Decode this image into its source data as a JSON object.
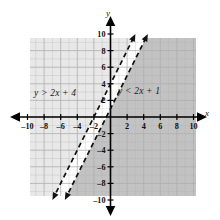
{
  "figure": {
    "kind": "coordinate-plane-graph",
    "axis_x_label": "x",
    "axis_y_label": "y"
  },
  "labels": {
    "left_inequality": "y > 2x + 4",
    "right_inequality": "y < 2x + 1"
  },
  "colors": {
    "grid_line": "#b0b0b0",
    "axis": "#000000",
    "line_stroke": "#111111",
    "shade_light": "#e8e8e8",
    "shade_dark": "#c2c2c2",
    "band_fill": "#ffffff",
    "tick_text": "#111111"
  },
  "chart_data": {
    "type": "line",
    "title": "",
    "xlabel": "x",
    "ylabel": "y",
    "xlim": [
      -10,
      10
    ],
    "ylim": [
      -10,
      10
    ],
    "grid": true,
    "legend": "inline-annotations",
    "x_ticks": [
      -10,
      -8,
      -6,
      -4,
      -2,
      2,
      4,
      6,
      8,
      10
    ],
    "y_ticks": [
      10,
      8,
      6,
      4,
      2,
      -2,
      -4,
      -6,
      -8,
      -10
    ],
    "x_tick_labels": [
      "-10",
      "-8",
      "-6",
      "-4",
      "-2",
      "2",
      "4",
      "6",
      "8",
      "10"
    ],
    "y_tick_labels": [
      "10",
      "8",
      "6",
      "4",
      "2",
      "-2",
      "-4",
      "-6",
      "-8",
      "-10"
    ],
    "tick_step": 2,
    "series": [
      {
        "name": "y > 2x + 4",
        "equation": "y = 2x + 4",
        "slope": 2,
        "intercept": 4,
        "style": "dashed",
        "arrows": "both",
        "inequality": "y > 2x + 4",
        "shaded_side": "above-left",
        "shade_color": "#e8e8e8"
      },
      {
        "name": "y < 2x + 1",
        "equation": "y = 2x + 1",
        "slope": 2,
        "intercept": 1,
        "style": "dashed",
        "arrows": "both",
        "inequality": "y < 2x + 1",
        "shaded_side": "below-right",
        "shade_color": "#c2c2c2"
      }
    ],
    "annotations": [
      {
        "text": "y > 2x + 4",
        "x": -7.0,
        "y": 2.6
      },
      {
        "text": "y < 2x + 1",
        "x": 2.4,
        "y": 2.9
      }
    ]
  }
}
